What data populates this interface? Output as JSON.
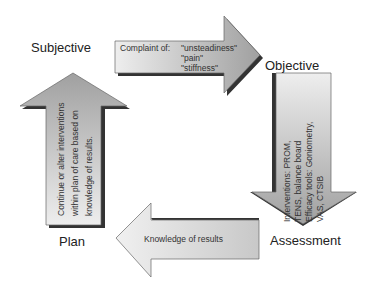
{
  "labels": {
    "subjective": "Subjective",
    "objective": "Objective",
    "assessment": "Assessment",
    "plan": "Plan"
  },
  "arrows": {
    "top": {
      "line1_label": "Complaint of:",
      "items": [
        "\"unsteadiness\"",
        "\"pain\"",
        "\"stiffness\""
      ]
    },
    "right": {
      "lines": [
        "Interventions: PROM,",
        "TENS, balance board",
        "Efficacy tools: Goniometry,",
        "VAS, CTSIB"
      ]
    },
    "bottom": {
      "text": "Knowledge of results"
    },
    "left": {
      "lines": [
        "Continue or alter interventions",
        "within plan of care based on",
        "knowledge of results."
      ]
    }
  },
  "colors": {
    "arrow_fill_light": "#e6e6e6",
    "arrow_fill_dark": "#a8a8a8",
    "shadow": "#3a3a3a",
    "outline": "#555555"
  }
}
